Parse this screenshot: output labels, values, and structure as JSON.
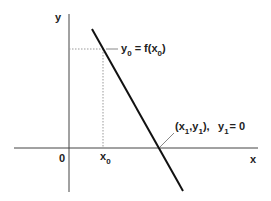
{
  "diagram": {
    "type": "function-graph",
    "axes": {
      "x_label": "x",
      "y_label": "y",
      "origin_label": "0"
    },
    "line": {
      "description": "straight line with negative slope crossing the x-axis",
      "color": "#111111"
    },
    "point_0": {
      "x_label": "x",
      "x_sub": "0",
      "annotation_y": "y",
      "annotation_y_sub": "0",
      "annotation_eq": " = f(x",
      "annotation_x_sub": "0",
      "annotation_close": ")"
    },
    "point_1": {
      "open": "(x",
      "x_sub": "1",
      "comma": ",y",
      "y_sub": "1",
      "close": "),",
      "cond_y": "y",
      "cond_sub": "1",
      "cond_eq": "= 0"
    },
    "colors": {
      "axis": "#444444",
      "guide": "#999999",
      "leader": "#888888"
    }
  }
}
